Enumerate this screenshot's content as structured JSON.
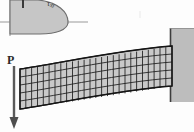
{
  "figure": {
    "background_color": "#fdfdfd"
  },
  "labels": {
    "load": "P",
    "shear_stress_symbol": "τ",
    "shear_stress_subscript": "xy"
  },
  "colors": {
    "beam_fill": "#c9c9c9",
    "mesh_line": "#1a1a1a",
    "wall_fill": "#b8b8b8",
    "wall_edge": "#4a4a4a",
    "arrow": "#555555",
    "axis": "#8f8f8f",
    "stress_fill": "#c4c4c4",
    "stress_edge": "#6a6a6a",
    "text": "#2a2a2a"
  },
  "stress_diagram": {
    "type": "parabolic-shear-distribution",
    "axis_horizontal_y": 22,
    "axis_vertical_x": 10,
    "peak_x": 62,
    "description": "Partial cropped parabolic shear stress distribution over beam depth"
  },
  "load_arrow": {
    "orientation": "down",
    "x": 14,
    "y_start": 66,
    "y_end": 128,
    "label": "P"
  },
  "beam": {
    "mesh_columns": 26,
    "mesh_rows": 5,
    "left_x": 20,
    "right_x": 172,
    "root_top_y": 46,
    "root_bottom_y": 86,
    "tip_top_y": 69,
    "tip_bottom_y": 109,
    "deflection_shape": "cantilever-tip-deflection"
  },
  "wall": {
    "x": 170,
    "y": 28,
    "width": 24,
    "height": 74,
    "description": "Fixed support block at right end"
  }
}
